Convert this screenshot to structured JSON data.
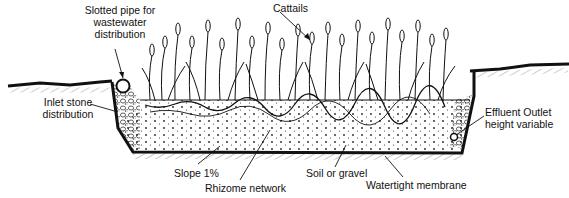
{
  "diagram": {
    "labels": {
      "cattails": "Cattails",
      "slotted_pipe_1": "Slotted pipe for",
      "slotted_pipe_2": "wastewater",
      "slotted_pipe_3": "distribution",
      "inlet_stone_1": "Inlet stone",
      "inlet_stone_2": "distribution",
      "effluent_1": "Effluent Outlet",
      "effluent_2": "height variable",
      "slope": "Slope 1%",
      "rhizome": "Rhizome network",
      "soil": "Soil or gravel",
      "membrane": "Watertight membrane"
    },
    "colors": {
      "ink": "#111111",
      "background": "#ffffff"
    }
  }
}
